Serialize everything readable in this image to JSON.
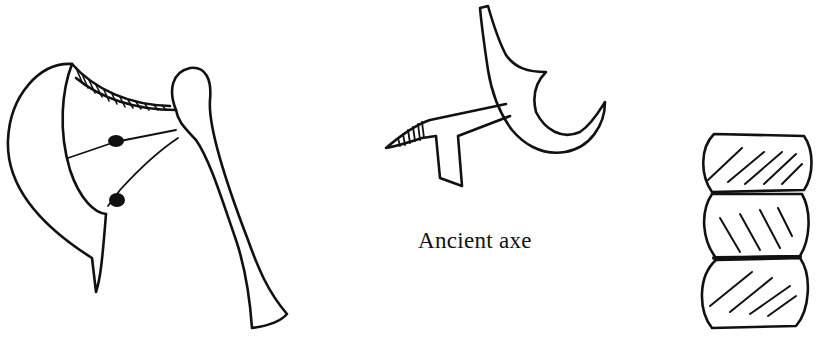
{
  "illustration": {
    "caption": "Ancient axe",
    "items": [
      {
        "id": "hafted-axe-large",
        "description": "Curved blade lashed to club-shaped handle, hatched top edge, two binding knots"
      },
      {
        "id": "antler-axe",
        "description": "Antler-handle axe with small hatched blade head"
      },
      {
        "id": "stacked-stones",
        "description": "Three stacked rounded stones with diagonal hatching"
      }
    ],
    "colors": {
      "ink": "#111111",
      "paper": "#ffffff"
    }
  }
}
